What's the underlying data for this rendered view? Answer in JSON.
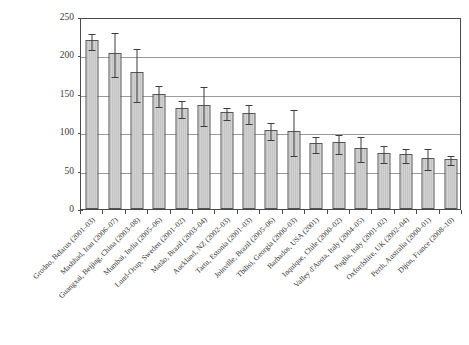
{
  "figure": {
    "top_strip_text": "",
    "caption_text": ""
  },
  "chart_data": {
    "type": "bar",
    "title": "",
    "xlabel": "",
    "ylabel": "Standardized incidence (n/100,000/year)",
    "ylim": [
      0,
      250
    ],
    "yticks": [
      0,
      50,
      100,
      150,
      200,
      250
    ],
    "grid": true,
    "legend": "none",
    "error_bars": "95% confidence interval",
    "categories": [
      "Grodno, Belarus (2001–03)",
      "Mashhad, Iran (2006–07)",
      "Guangxai, Beijing, China (2003–08)",
      "Mumbai, India (2005–06)",
      "Lund-Orup, Sweden (2001–02)",
      "Matão, Brazil (2003–04)",
      "Auckland, NZ (2002–03)",
      "Tartu, Estonia (2001–03)",
      "Joinville, Brazil (2005–06)",
      "Tbilisi, Georgia (2000–03)",
      "Barbados, USA (2001)",
      "Inquique, Chile (2000–02)",
      "Valley d'Aosta, Italy (2004–05)",
      "Puglia, Italy (2001–02)",
      "Oxfordshire, UK (2002–04)",
      "Perth, Australia (2000–01)",
      "Dijon, France (2008–10)"
    ],
    "values": [
      220,
      203,
      178,
      150,
      131,
      136,
      126,
      125,
      103,
      101,
      86,
      87,
      80,
      73,
      71,
      66,
      65
    ],
    "ci_low": [
      210,
      174,
      142,
      135,
      121,
      111,
      118,
      113,
      92,
      72,
      76,
      74,
      64,
      62,
      63,
      54,
      60
    ],
    "ci_high": [
      231,
      232,
      211,
      163,
      143,
      161,
      134,
      138,
      115,
      131,
      97,
      99,
      96,
      85,
      81,
      81,
      71
    ]
  }
}
